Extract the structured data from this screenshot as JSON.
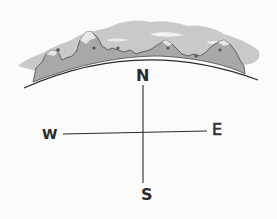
{
  "illustration": {
    "description": "Hand-drawn compass with mountain range on a curved horizon",
    "colors": {
      "background": "#fbfbfb",
      "clouds": "#c9c9c9",
      "mountains": "#a8a8a8",
      "ink": "#2a2a2a"
    }
  },
  "compass": {
    "north": "N",
    "south": "S",
    "east": "E",
    "west": "W"
  }
}
